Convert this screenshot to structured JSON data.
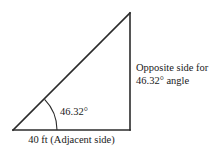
{
  "figure": {
    "type": "right-triangle-trigonometry-diagram",
    "angle_label": "46.32°",
    "opposite_side_label_line1": "Opposite side for",
    "opposite_side_label_line2": "46.32° angle",
    "adjacent_side_label": "40 ft (Adjacent side)",
    "stroke_color": "#2b2b2b",
    "background_color": "#ffffff"
  },
  "geometry": {
    "left_vertex": {
      "x": 13,
      "y": 130
    },
    "right_vertex": {
      "x": 130,
      "y": 130
    },
    "apex_vertex": {
      "x": 130,
      "y": 13
    },
    "arc_radius": 44,
    "angle_degrees": 46.32,
    "adjacent_length_ft": 40
  }
}
